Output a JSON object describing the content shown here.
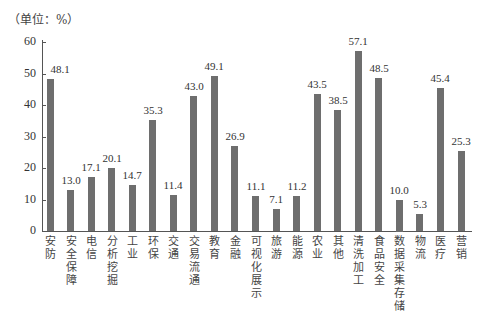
{
  "chart_data": {
    "type": "bar",
    "title": "",
    "unit_label": "（单位：%）",
    "xlabel": "",
    "ylabel": "%",
    "ylim": [
      0,
      60
    ],
    "yticks": [
      0,
      10,
      20,
      30,
      40,
      50,
      60
    ],
    "grid": false,
    "legend": null,
    "categories": [
      "安防",
      "安全保障",
      "电信",
      "分析挖掘",
      "工业",
      "环保",
      "交通",
      "交易流通",
      "教育",
      "金融",
      "可视化展示",
      "旅游",
      "能源",
      "农业",
      "其他",
      "清洗加工",
      "食品安全",
      "数据采集存储",
      "物流",
      "医疗",
      "营销"
    ],
    "values": [
      48.1,
      13.0,
      17.1,
      20.1,
      14.7,
      35.3,
      11.4,
      43.0,
      49.1,
      26.9,
      11.1,
      7.1,
      11.2,
      43.5,
      38.5,
      57.1,
      48.5,
      10.0,
      5.3,
      45.4,
      25.3
    ],
    "value_labels": [
      "48.1",
      "13.0",
      "17.1",
      "20.1",
      "14.7",
      "35.3",
      "11.4",
      "43.0",
      "49.1",
      "26.9",
      "11.1",
      "7.1",
      "11.2",
      "43.5",
      "38.5",
      "57.1",
      "48.5",
      "10.0",
      "5.3",
      "45.4",
      "25.3"
    ],
    "bar_color": "#6e6e6e"
  }
}
